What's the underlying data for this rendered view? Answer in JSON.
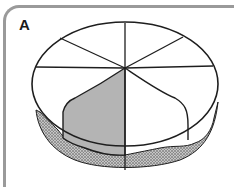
{
  "panel": {
    "label": "A"
  },
  "diagram": {
    "segments": 8,
    "shaded_segment_color": "#b4b4b4",
    "outline_color": "#1e1e1e",
    "frame_color": "#9a9a9a",
    "stipple_color": "#3a3a3a"
  }
}
